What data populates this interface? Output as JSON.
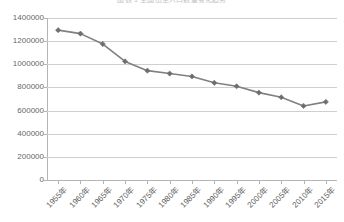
{
  "chart_data": {
    "type": "line",
    "title": "图表 1  全国出生人口数量变化趋势",
    "xlabel": "",
    "ylabel": "",
    "categories": [
      "1955年",
      "1960年",
      "1965年",
      "1970年",
      "1975年",
      "1980年",
      "1985年",
      "1990年",
      "1995年",
      "2000年",
      "2005年",
      "2010年",
      "2015年"
    ],
    "values": [
      1295000,
      1265000,
      1175000,
      1025000,
      945000,
      920000,
      895000,
      840000,
      810000,
      755000,
      715000,
      640000,
      675000
    ],
    "series": [
      {
        "name": "series1",
        "values": [
          1295000,
          1265000,
          1175000,
          1025000,
          945000,
          920000,
          895000,
          840000,
          810000,
          755000,
          715000,
          640000,
          675000
        ]
      }
    ],
    "ylim": [
      0,
      1400000
    ],
    "y_ticks": [
      0,
      200000,
      400000,
      600000,
      800000,
      1000000,
      1200000,
      1400000
    ],
    "y_tick_labels": [
      "0",
      "200000",
      "400000",
      "600000",
      "800000",
      "1000000",
      "1200000",
      "1400000"
    ],
    "grid": true,
    "legend": false,
    "legend_position": "none",
    "marker": "diamond",
    "line_color": "#808080",
    "marker_color": "#6e6e6e",
    "grid_color": "#cfcfcf",
    "axis_color": "#b5b5b5",
    "annotations": []
  }
}
